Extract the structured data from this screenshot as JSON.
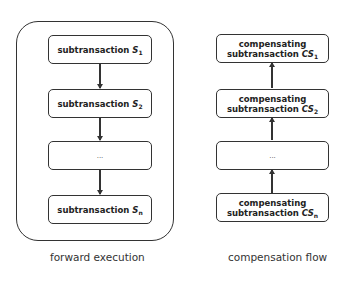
{
  "forward": {
    "caption": "forward execution",
    "boxes": [
      {
        "text": "subtransaction ",
        "sym": "S",
        "sub": "1"
      },
      {
        "text": "subtransaction ",
        "sym": "S",
        "sub": "2"
      },
      {
        "text": "...",
        "sym": "",
        "sub": ""
      },
      {
        "text": "subtransaction ",
        "sym": "S",
        "sub": "n"
      }
    ]
  },
  "compensation": {
    "caption": "compensation flow",
    "boxes": [
      {
        "line1": "compensating",
        "text": "subtransaction ",
        "sym": "CS",
        "sub": "1"
      },
      {
        "line1": "compensating",
        "text": "subtransaction ",
        "sym": "CS",
        "sub": "2"
      },
      {
        "line1": "",
        "text": "...",
        "sym": "",
        "sub": ""
      },
      {
        "line1": "compensating",
        "text": "subtransaction ",
        "sym": "CS",
        "sub": "n"
      }
    ]
  },
  "colors": {
    "stroke": "#333333",
    "background": "#ffffff"
  }
}
